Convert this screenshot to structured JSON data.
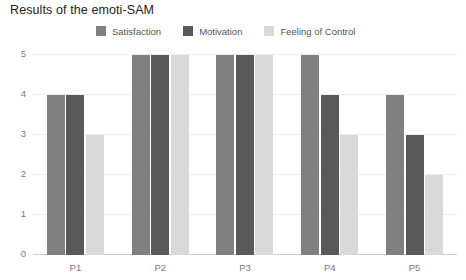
{
  "chart_data": {
    "type": "bar",
    "title": "Results of the emoti-SAM",
    "xlabel": "",
    "ylabel": "",
    "ylim": [
      0,
      5
    ],
    "yticks": [
      0,
      1,
      2,
      3,
      4,
      5
    ],
    "grid": true,
    "legend_position": "top-center",
    "categories": [
      "P1",
      "P2",
      "P3",
      "P4",
      "P5"
    ],
    "series": [
      {
        "name": "Satisfaction",
        "color": "#808080",
        "values": [
          4,
          5,
          5,
          5,
          4
        ]
      },
      {
        "name": "Motivation",
        "color": "#595959",
        "values": [
          4,
          5,
          5,
          4,
          3
        ]
      },
      {
        "name": "Feeling of Control",
        "color": "#d9d9d9",
        "values": [
          3,
          5,
          5,
          3,
          2
        ]
      }
    ]
  },
  "colors": {
    "background": "#ffffff",
    "title": "#212121",
    "tick_label": "#7a7a7a",
    "legend_label": "#555555",
    "gridline": "#eeeeee",
    "axis_line": "#cfcfcf"
  }
}
